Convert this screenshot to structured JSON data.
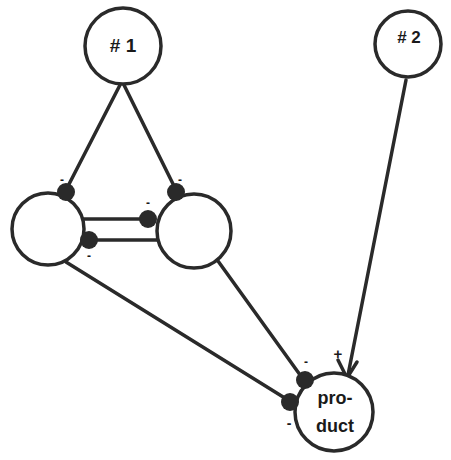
{
  "diagram": {
    "stroke_color": "#2a2a2a",
    "fill_color": "#ffffff",
    "nodes": [
      {
        "id": "n1",
        "label": "# 1",
        "cx": 123,
        "cy": 46,
        "r": 39
      },
      {
        "id": "n2",
        "label": "# 2",
        "cx": 408,
        "cy": 44,
        "r": 34
      },
      {
        "id": "left",
        "label": "",
        "cx": 48,
        "cy": 229,
        "r": 37
      },
      {
        "id": "right",
        "label": "",
        "cx": 194,
        "cy": 231,
        "r": 38
      },
      {
        "id": "product",
        "label_line1": "pro-",
        "label_line2": "duct",
        "cx": 334,
        "cy": 410,
        "r": 40
      }
    ],
    "edges": [
      {
        "from": "n1",
        "to": "left",
        "type": "inhibit",
        "sign": "-"
      },
      {
        "from": "n1",
        "to": "right",
        "type": "inhibit",
        "sign": "-"
      },
      {
        "from": "left",
        "to": "right",
        "type": "inhibit",
        "sign": "-"
      },
      {
        "from": "right",
        "to": "left",
        "type": "inhibit",
        "sign": "-"
      },
      {
        "from": "right",
        "to": "product",
        "type": "inhibit",
        "sign": "-"
      },
      {
        "from": "left",
        "to": "product",
        "type": "inhibit",
        "sign": "-"
      },
      {
        "from": "n2",
        "to": "product",
        "type": "excite",
        "sign": "+"
      }
    ],
    "signs": {
      "minus": "-",
      "plus": "+"
    }
  }
}
